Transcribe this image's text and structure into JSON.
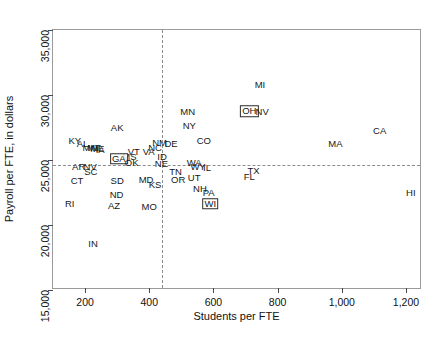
{
  "chart_data": {
    "type": "scatter",
    "title": "",
    "xlabel": "Students per FTE",
    "ylabel": "Payroll per FTE, in dollars",
    "xlim": [
      100,
      1250
    ],
    "ylim": [
      15000,
      35000
    ],
    "xticks": [
      200,
      400,
      600,
      800,
      1000,
      1200
    ],
    "xtick_labels": [
      "200",
      "400",
      "600",
      "800",
      "1,000",
      "1,200"
    ],
    "yticks": [
      15000,
      20000,
      25000,
      30000,
      35000
    ],
    "ytick_labels": [
      "15,000",
      "20,000",
      "25,000",
      "30,000",
      "35,000"
    ],
    "grid": false,
    "legend": "none",
    "point_marker": "state-abbreviation-label",
    "reference_lines": {
      "vertical_x": 440,
      "horizontal_y": 24600,
      "style": "dashed"
    },
    "highlighted_points": [
      "GA",
      "OH",
      "WI"
    ],
    "points": [
      {
        "label": "AK",
        "x": 300,
        "y": 27450
      },
      {
        "label": "KY",
        "x": 168,
        "y": 26500
      },
      {
        "label": "AL",
        "x": 192,
        "y": 26250
      },
      {
        "label": "MN",
        "x": 215,
        "y": 25950
      },
      {
        "label": "MT",
        "x": 228,
        "y": 25900
      },
      {
        "label": "IA",
        "x": 247,
        "y": 25800
      },
      {
        "label": "ME",
        "x": 238,
        "y": 25880
      },
      {
        "label": "NM",
        "x": 432,
        "y": 26300
      },
      {
        "label": "NC",
        "x": 418,
        "y": 25900
      },
      {
        "label": "VA",
        "x": 398,
        "y": 25600
      },
      {
        "label": "VT",
        "x": 352,
        "y": 25600
      },
      {
        "label": "MS",
        "x": 338,
        "y": 25250
      },
      {
        "label": "GA",
        "x": 305,
        "y": 25100
      },
      {
        "label": "OK",
        "x": 345,
        "y": 24800
      },
      {
        "label": "DE",
        "x": 468,
        "y": 26200
      },
      {
        "label": "ID",
        "x": 440,
        "y": 25200
      },
      {
        "label": "NE",
        "x": 438,
        "y": 24700
      },
      {
        "label": "MN",
        "x": 520,
        "y": 28700
      },
      {
        "label": "NY",
        "x": 525,
        "y": 27650
      },
      {
        "label": "CO",
        "x": 570,
        "y": 26450
      },
      {
        "label": "AR",
        "x": 180,
        "y": 24500
      },
      {
        "label": "NV",
        "x": 216,
        "y": 24500
      },
      {
        "label": "SC",
        "x": 218,
        "y": 24100
      },
      {
        "label": "CT",
        "x": 175,
        "y": 23400
      },
      {
        "label": "SD",
        "x": 300,
        "y": 23400
      },
      {
        "label": "MD",
        "x": 390,
        "y": 23450
      },
      {
        "label": "KS",
        "x": 418,
        "y": 23100
      },
      {
        "label": "TN",
        "x": 482,
        "y": 24050
      },
      {
        "label": "OR",
        "x": 490,
        "y": 23450
      },
      {
        "label": "WA",
        "x": 540,
        "y": 24750
      },
      {
        "label": "WY",
        "x": 552,
        "y": 24450
      },
      {
        "label": "IL",
        "x": 580,
        "y": 24400
      },
      {
        "label": "UT",
        "x": 540,
        "y": 23650
      },
      {
        "label": "NH",
        "x": 558,
        "y": 22800
      },
      {
        "label": "PA",
        "x": 585,
        "y": 22450
      },
      {
        "label": "WI",
        "x": 590,
        "y": 21650
      },
      {
        "label": "TX",
        "x": 725,
        "y": 24150
      },
      {
        "label": "FL",
        "x": 712,
        "y": 23700
      },
      {
        "label": "ND",
        "x": 298,
        "y": 22300
      },
      {
        "label": "RI",
        "x": 152,
        "y": 21600
      },
      {
        "label": "AZ",
        "x": 290,
        "y": 21450
      },
      {
        "label": "MO",
        "x": 400,
        "y": 21350
      },
      {
        "label": "IN",
        "x": 225,
        "y": 18550
      },
      {
        "label": "MI",
        "x": 745,
        "y": 30800
      },
      {
        "label": "OH",
        "x": 712,
        "y": 28750
      },
      {
        "label": "NV",
        "x": 752,
        "y": 28700
      },
      {
        "label": "CA",
        "x": 1118,
        "y": 27250
      },
      {
        "label": "MA",
        "x": 980,
        "y": 26200
      },
      {
        "label": "HI",
        "x": 1215,
        "y": 22500
      }
    ]
  },
  "caption": ""
}
